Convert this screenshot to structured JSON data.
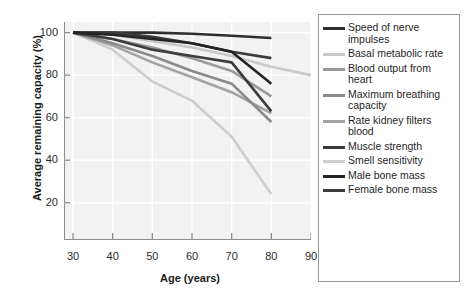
{
  "chart_data": {
    "type": "line",
    "title": "",
    "xlabel": "Age (years)",
    "ylabel": "Average remaining capacity (%)",
    "x": [
      30,
      40,
      50,
      60,
      70,
      80,
      90
    ],
    "xticks": [
      30,
      40,
      50,
      60,
      70,
      80,
      90
    ],
    "yticks": [
      20,
      40,
      60,
      80,
      100
    ],
    "xlim": [
      30,
      90
    ],
    "ylim": [
      10,
      105
    ],
    "grid": true,
    "grid_color": "#ffffff",
    "plot_background": "#f2f2f2",
    "legend_position": "right",
    "series": [
      {
        "name": "Speed of nerve impulses",
        "color": "#2e2e2e",
        "x": [
          30,
          40,
          50,
          60,
          70,
          80
        ],
        "values": [
          100,
          100,
          100,
          99.5,
          98.5,
          97.5
        ]
      },
      {
        "name": "Basal metabolic rate",
        "color": "#c9c9c9",
        "x": [
          30,
          40,
          50,
          60,
          70,
          80,
          90
        ],
        "values": [
          100,
          99,
          96,
          93,
          89,
          84,
          80
        ]
      },
      {
        "name": "Blood output from heart",
        "color": "#9a9a9a",
        "x": [
          30,
          40,
          50,
          60,
          70,
          80
        ],
        "values": [
          100,
          97,
          93,
          88,
          82,
          70
        ]
      },
      {
        "name": "Maximum breathing capacity",
        "color": "#8a8a8a",
        "x": [
          30,
          40,
          50,
          60,
          70,
          80
        ],
        "values": [
          100,
          95,
          89,
          82,
          76,
          58
        ]
      },
      {
        "name": "Rate kidney filters blood",
        "color": "#a3a3a3",
        "x": [
          30,
          40,
          50,
          60,
          70,
          80
        ],
        "values": [
          100,
          94,
          86,
          79,
          72,
          62
        ]
      },
      {
        "name": "Muscle strength",
        "color": "#3a3a3a",
        "x": [
          30,
          40,
          50,
          60,
          70,
          80
        ],
        "values": [
          100,
          100,
          98,
          95,
          91,
          88
        ]
      },
      {
        "name": "Smell sensitivity",
        "color": "#cdcdcd",
        "x": [
          30,
          40,
          50,
          60,
          70,
          80
        ],
        "values": [
          100,
          92,
          77,
          68,
          51,
          24
        ]
      },
      {
        "name": "Male bone mass",
        "color": "#242424",
        "x": [
          30,
          40,
          50,
          60,
          70,
          80
        ],
        "values": [
          100,
          99,
          97,
          95,
          91,
          76
        ]
      },
      {
        "name": "Female bone mass",
        "color": "#3d3d3d",
        "x": [
          30,
          40,
          50,
          60,
          70,
          80
        ],
        "values": [
          100,
          97,
          92,
          89,
          86,
          63
        ]
      }
    ]
  },
  "axes": {
    "ylabel": "Average remaining capacity (%)",
    "xlabel": "Age (years)",
    "ytick_labels": [
      "100",
      "80",
      "60",
      "40",
      "20"
    ],
    "xtick_labels": [
      "30",
      "40",
      "50",
      "60",
      "70",
      "80",
      "90"
    ]
  },
  "legend": {
    "items": [
      {
        "label": "Speed of nerve impulses",
        "color": "#2e2e2e"
      },
      {
        "label": "Basal metabolic rate",
        "color": "#c9c9c9"
      },
      {
        "label": "Blood output from heart",
        "color": "#9a9a9a"
      },
      {
        "label": "Maximum breathing capacity",
        "color": "#8a8a8a"
      },
      {
        "label": "Rate kidney filters blood",
        "color": "#a3a3a3"
      },
      {
        "label": "Muscle strength",
        "color": "#3a3a3a"
      },
      {
        "label": "Smell sensitivity",
        "color": "#cdcdcd"
      },
      {
        "label": "Male bone mass",
        "color": "#242424"
      },
      {
        "label": "Female bone mass",
        "color": "#3d3d3d"
      }
    ]
  }
}
